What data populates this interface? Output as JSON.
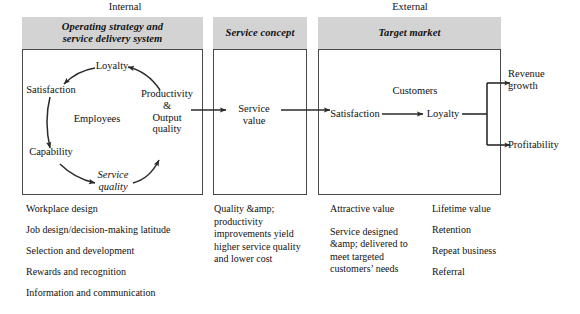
{
  "figure": {
    "zones": [
      {
        "id": "internal",
        "label": "Internal"
      },
      {
        "id": "external",
        "label": "External"
      }
    ],
    "panels": [
      {
        "id": "operating-strategy",
        "title": "Operating strategy and service delivery system",
        "title_line1": "Operating strategy and",
        "title_line2": "service delivery system"
      },
      {
        "id": "service-concept",
        "title": "Service concept",
        "title_line1": "Service concept",
        "title_line2": ""
      },
      {
        "id": "target-market",
        "title": "Target market",
        "title_line1": "Target market",
        "title_line2": ""
      }
    ],
    "employee_cycle": {
      "center_label": "Employees",
      "nodes": [
        {
          "id": "loyalty",
          "label": "Loyalty"
        },
        {
          "id": "satisfaction",
          "label": "Satisfaction"
        },
        {
          "id": "capability",
          "label": "Capability"
        },
        {
          "id": "service-quality",
          "label_line1": "Service",
          "label_line2": "quality"
        },
        {
          "id": "productivity-output-quality",
          "label_line1": "Productivity",
          "label_line2": "&",
          "label_line3": "Output",
          "label_line4": "quality"
        }
      ]
    },
    "service_concept_node": {
      "label_line1": "Service",
      "label_line2": "value"
    },
    "customer_chain": {
      "center_label": "Customers",
      "satisfaction": "Satisfaction",
      "loyalty": "Loyalty"
    },
    "outcomes": [
      {
        "id": "revenue-growth",
        "label_line1": "Revenue",
        "label_line2": "growth"
      },
      {
        "id": "profitability",
        "label_line1": "Profitability",
        "label_line2": ""
      }
    ],
    "lists": {
      "internal_drivers": [
        "Workplace design",
        "Job design/decision-making latitude",
        "Selection and development",
        "Rewards and recognition",
        "Information and communication"
      ],
      "service_concept_notes": [
        "Quality &amp; productivity",
        "improvements yield",
        "higher service quality",
        "and lower cost"
      ],
      "target_market_left": [
        "Attractive value",
        "Service designed",
        "&amp; delivered to",
        "meet targeted",
        "customers’ needs"
      ],
      "target_market_right": [
        "Lifetime value",
        "Retention",
        "Repeat business",
        "Referral"
      ]
    },
    "colors": {
      "header_fill": "#d3d3d3",
      "line": "#2b2b2b",
      "border": "#4a4a4a",
      "text": "#111111"
    }
  }
}
